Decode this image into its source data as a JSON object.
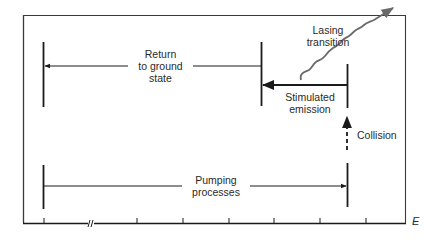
{
  "diagram": {
    "type": "energy-level process diagram (laser action)",
    "axis": {
      "label": "E",
      "tick_count": 7,
      "has_axis_break": true
    },
    "labels": {
      "return_to_ground": [
        "Return",
        "to ground",
        "state"
      ],
      "lasing_transition": [
        "Lasing",
        "transition"
      ],
      "stimulated_emission": [
        "Stimulated",
        "emission"
      ],
      "collision": [
        "Collision"
      ],
      "pumping_processes": [
        "Pumping",
        "processes"
      ]
    },
    "processes": [
      {
        "name": "Pumping processes",
        "from": "ground level",
        "to": "upper pump level",
        "arrow": "solid, rightward"
      },
      {
        "name": "Collision",
        "from": "upper pump level",
        "to": "upper lasing level",
        "arrow": "dashed, upward"
      },
      {
        "name": "Stimulated emission",
        "from": "upper lasing level",
        "to": "lower lasing level",
        "arrow": "solid, leftward"
      },
      {
        "name": "Lasing transition",
        "from": "stimulated emission",
        "to": "output photon",
        "arrow": "wavy, up-right"
      },
      {
        "name": "Return to ground state",
        "from": "lower lasing level",
        "to": "ground level",
        "arrow": "solid, leftward"
      }
    ],
    "colors": {
      "line": "#1a1a1a",
      "frame": "#3a3a3a",
      "wavy": "#6a6a6a",
      "background": "#ffffff"
    }
  }
}
